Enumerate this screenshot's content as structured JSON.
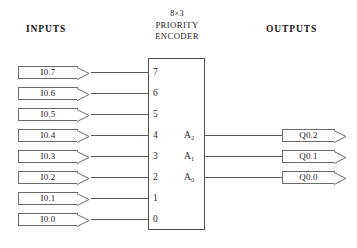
{
  "diagram": {
    "type": "logic-block-diagram",
    "headings": {
      "inputs": "INPUTS",
      "outputs": "OUTPUTS"
    },
    "block": {
      "title_line1": "8×3",
      "title_line2": "PRIORITY",
      "title_line3": "ENCODER",
      "input_pins": [
        "7",
        "6",
        "5",
        "4",
        "3",
        "2",
        "1",
        "0"
      ],
      "output_pins": [
        {
          "name": "A",
          "subscript": "2"
        },
        {
          "name": "A",
          "subscript": "1"
        },
        {
          "name": "A",
          "subscript": "0"
        }
      ]
    },
    "inputs": [
      {
        "label": "I0.7",
        "pin": "7"
      },
      {
        "label": "I0.6",
        "pin": "6"
      },
      {
        "label": "I0.5",
        "pin": "5"
      },
      {
        "label": "I0.4",
        "pin": "4"
      },
      {
        "label": "I0.3",
        "pin": "3"
      },
      {
        "label": "I0.2",
        "pin": "2"
      },
      {
        "label": "I0.1",
        "pin": "1"
      },
      {
        "label": "I0.0",
        "pin": "0"
      }
    ],
    "outputs": [
      {
        "label": "Q0.2",
        "pin": "A2"
      },
      {
        "label": "Q0.1",
        "pin": "A1"
      },
      {
        "label": "Q0.0",
        "pin": "A0"
      }
    ],
    "colors": {
      "line": "#595959",
      "box_border": "#4c4c4c",
      "tag_border": "#6b6b6b",
      "text": "#232323",
      "background": "#ffffff"
    }
  }
}
